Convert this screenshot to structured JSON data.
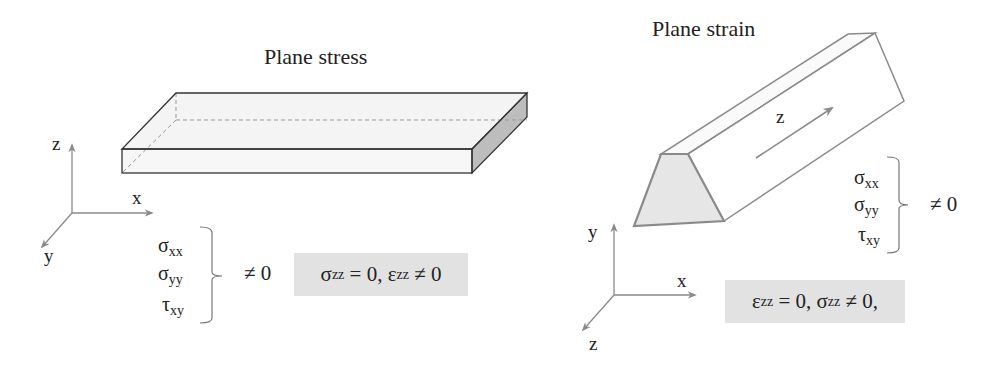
{
  "left_panel": {
    "title": "Plane stress",
    "axes": {
      "z": "z",
      "x": "x",
      "y": "y"
    },
    "components": [
      {
        "sym": "σ",
        "sub": "xx"
      },
      {
        "sym": "σ",
        "sub": "yy"
      },
      {
        "sym": "τ",
        "sub": "xy"
      }
    ],
    "nonzero_label": "≠ 0",
    "condition": {
      "a_sym": "σ",
      "a_sub": "zz",
      "a_rel": " = 0, ",
      "b_sym": "ε",
      "b_sub": "zz",
      "b_rel": " ≠ 0"
    }
  },
  "right_panel": {
    "title": "Plane strain",
    "axes": {
      "y": "y",
      "x": "x",
      "z": "z"
    },
    "prism_axis_label": "z",
    "components": [
      {
        "sym": "σ",
        "sub": "xx"
      },
      {
        "sym": "σ",
        "sub": "yy"
      },
      {
        "sym": "τ",
        "sub": "xy"
      }
    ],
    "nonzero_label": "≠ 0",
    "condition": {
      "a_sym": "ε",
      "a_sub": "zz",
      "a_rel": " = 0, ",
      "b_sym": "σ",
      "b_sub": "zz",
      "b_rel": " ≠ 0,"
    }
  },
  "colors": {
    "line": "#333333",
    "axis": "#8a8a8a",
    "shade": "#e6e6e6",
    "side": "#bdbdbd",
    "box": "#e2e2e2"
  }
}
